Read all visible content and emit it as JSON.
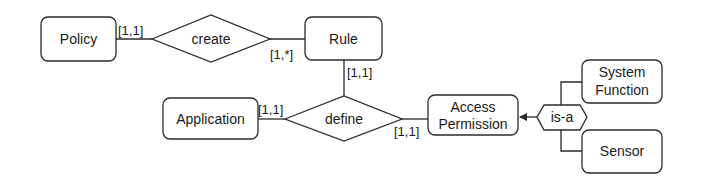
{
  "diagram": {
    "type": "entity-relationship",
    "entities": [
      {
        "id": "policy",
        "label": "Policy"
      },
      {
        "id": "rule",
        "label": "Rule"
      },
      {
        "id": "application",
        "label": "Application"
      },
      {
        "id": "access_permission",
        "label_line1": "Access",
        "label_line2": "Permission"
      },
      {
        "id": "system_function",
        "label_line1": "System",
        "label_line2": "Function"
      },
      {
        "id": "sensor",
        "label": "Sensor"
      }
    ],
    "relationships": [
      {
        "id": "create",
        "label": "create"
      },
      {
        "id": "define",
        "label": "define"
      }
    ],
    "specialization": {
      "id": "is_a",
      "label": "is-a"
    },
    "cardinalities": {
      "policy_create": "[1,1]",
      "create_rule": "[1,*]",
      "rule_define": "[1,1]",
      "application_define": "[1,1]",
      "define_access_permission": "[1,1]"
    }
  }
}
